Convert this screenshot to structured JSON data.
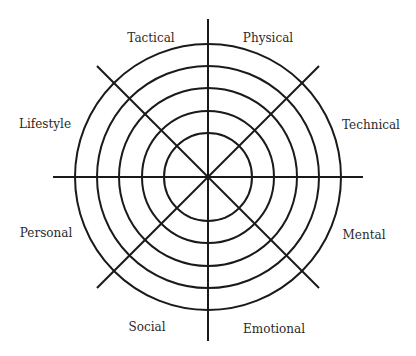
{
  "diagram": {
    "type": "wheel",
    "center": [
      208,
      177
    ],
    "ring_radii": [
      44,
      66,
      89,
      111,
      133
    ],
    "spoke_lengths": {
      "vertical_top": 158,
      "vertical_bottom": 164,
      "horizontal": 155,
      "diagonal": 157
    },
    "stroke_color": "#1a1a1a",
    "stroke_width": 2,
    "labels": [
      {
        "text": "Tactical",
        "x": 151,
        "y": 38
      },
      {
        "text": "Physical",
        "x": 268,
        "y": 38
      },
      {
        "text": "Technical",
        "x": 371,
        "y": 125
      },
      {
        "text": "Lifestyle",
        "x": 45,
        "y": 124
      },
      {
        "text": "Personal",
        "x": 46,
        "y": 233
      },
      {
        "text": "Mental",
        "x": 364,
        "y": 235
      },
      {
        "text": "Social",
        "x": 147,
        "y": 327
      },
      {
        "text": "Emotional",
        "x": 274,
        "y": 329
      }
    ]
  }
}
